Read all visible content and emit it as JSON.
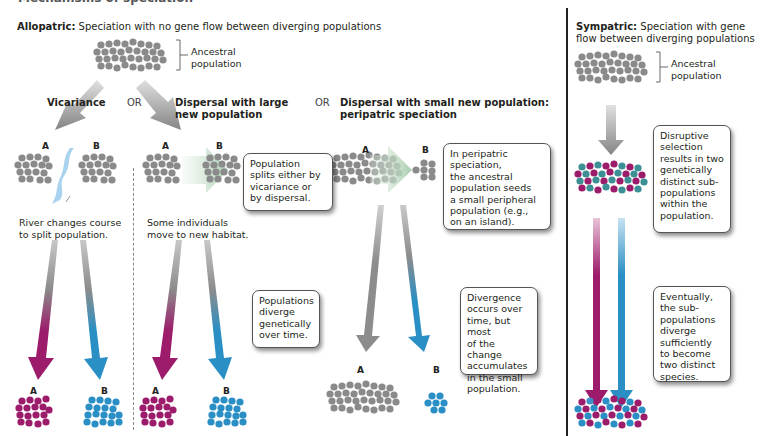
{
  "title_strip": "Mechanisms of speciation",
  "allopatric": {
    "heading_bold": "Allopatric:",
    "heading_rest": " Speciation with no gene flow between diverging populations",
    "ancestral_label": "Ancestral\npopulation",
    "or_labels": [
      "OR",
      "OR"
    ],
    "vicariance": {
      "title": "Vicariance",
      "label_a": "A",
      "label_b": "B",
      "caption": "River changes course\nto split population.",
      "bottom_a": "A",
      "bottom_b": "B"
    },
    "dispersal_large": {
      "title": "Dispersal with large\nnew population",
      "label_a": "A",
      "label_b": "B",
      "caption": "Some individuals\nmove to new habitat.",
      "note_split": "Population\nsplits either by\nvicariance or\nby dispersal.",
      "note_diverge": "Populations\ndiverge\ngenetically\nover time.",
      "bottom_a": "A",
      "bottom_b": "B"
    },
    "dispersal_small": {
      "title": "Dispersal with small new population:\nperipatric speciation",
      "label_a": "A",
      "label_b": "B",
      "note_peripatric": "In peripatric\nspeciation,\nthe ancestral\npopulation seeds\na small peripheral\npopulation (e.g.,\non an island).",
      "note_divergence": "Divergence\noccurs over\ntime, but most\nof the change\naccumulates\nin the small\npopulation.",
      "bottom_a": "A",
      "bottom_b": "B"
    }
  },
  "sympatric": {
    "heading_bold": "Sympatric:",
    "heading_rest": " Speciation with gene\nflow between diverging populations",
    "ancestral_label": "Ancestral\npopulation",
    "note_disruptive": "Disruptive\nselection\nresults in two\ngenetically\ndistinct sub-\npopulations\nwithin the\npopulation.",
    "note_eventually": "Eventually,\nthe sub-\npopulations\ndiverge\nsufficiently\nto become\ntwo distinct\nspecies."
  },
  "colors": {
    "gray_dot": "#8a8a8a",
    "magenta": "#9c1c6b",
    "blue": "#2a8fc4",
    "teal": "#3d8f96",
    "river": "#a9d3ee",
    "arrow_gray": "#8c8c8c",
    "dispersal_arrow": "#b9d6bd"
  }
}
